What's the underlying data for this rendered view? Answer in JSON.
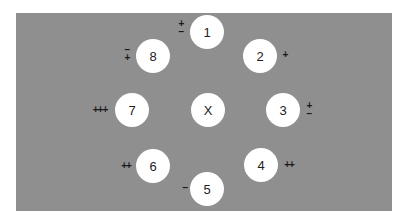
{
  "diagram": {
    "center": {
      "label": "X",
      "x": 208,
      "y": 110
    },
    "nodes": [
      {
        "label": "1",
        "x": 207,
        "y": 32,
        "mark": "+\n−",
        "mx": 181,
        "my": 28
      },
      {
        "label": "2",
        "x": 260,
        "y": 56,
        "mark": "+",
        "mx": 285,
        "my": 55
      },
      {
        "label": "3",
        "x": 283,
        "y": 110,
        "mark": "+\n−",
        "mx": 309,
        "my": 110
      },
      {
        "label": "4",
        "x": 261,
        "y": 165,
        "mark": "++",
        "mx": 289,
        "my": 165
      },
      {
        "label": "5",
        "x": 207,
        "y": 189,
        "mark": "−",
        "mx": 185,
        "my": 188
      },
      {
        "label": "6",
        "x": 153,
        "y": 166,
        "mark": "++",
        "mx": 126,
        "my": 166
      },
      {
        "label": "7",
        "x": 132,
        "y": 110,
        "mark": "+++",
        "mx": 100,
        "my": 110
      },
      {
        "label": "8",
        "x": 153,
        "y": 56,
        "mark": "−\n+",
        "mx": 127,
        "my": 54
      }
    ]
  }
}
